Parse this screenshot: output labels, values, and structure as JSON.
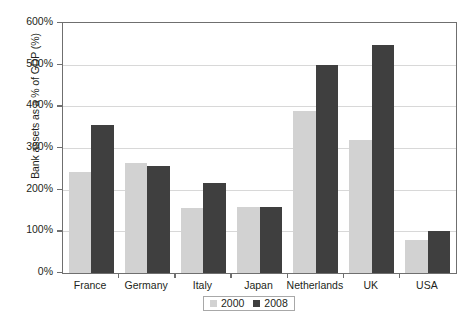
{
  "chart_data": {
    "type": "bar",
    "title": "",
    "xlabel": "",
    "ylabel": "Bank assets as a % of GDP (%)",
    "categories": [
      "France",
      "Germany",
      "Italy",
      "Japan",
      "Netherlands",
      "UK",
      "USA"
    ],
    "series": [
      {
        "name": "2000",
        "color": "#d2d2d2",
        "values": [
          243,
          263,
          157,
          158,
          388,
          320,
          80
        ]
      },
      {
        "name": "2008",
        "color": "#3f3f3f",
        "values": [
          355,
          257,
          217,
          158,
          500,
          547,
          102
        ]
      }
    ],
    "ylim": [
      0,
      600
    ],
    "ytick_values": [
      0,
      100,
      200,
      300,
      400,
      500,
      600
    ],
    "ytick_labels": [
      "0%",
      "100%",
      "200%",
      "300%",
      "400%",
      "500%",
      "600%"
    ],
    "grid": true,
    "legend_position": "bottom-center",
    "legend_entries": [
      "2000",
      "2008"
    ]
  }
}
